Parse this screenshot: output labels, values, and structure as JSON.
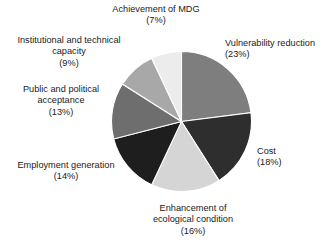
{
  "chart_data": {
    "type": "pie",
    "title": "",
    "subtitle": "",
    "xlabel": "",
    "ylabel": "",
    "legend_position": "outside-labels",
    "grid": false,
    "units": "percent",
    "start_angle_deg": 0,
    "direction": "clockwise",
    "categories": [
      "Vulnerability reduction",
      "Cost",
      "Enhancement of ecological condition",
      "Employment generation",
      "Public and political acceptance",
      "Institutional and technical capacity",
      "Achievement of MDG"
    ],
    "values": [
      23,
      18,
      16,
      14,
      13,
      9,
      7
    ],
    "colors": [
      "#7e7e7e",
      "#2e2e2e",
      "#d5d5d5",
      "#1e1e1e",
      "#6e6e6e",
      "#a8a8a8",
      "#ececec"
    ],
    "slices": [
      {
        "label": "Vulnerability reduction",
        "value": 23,
        "pct_text": "(23%)",
        "color": "#7e7e7e"
      },
      {
        "label": "Cost",
        "value": 18,
        "pct_text": "(18%)",
        "color": "#2e2e2e"
      },
      {
        "label": "Enhancement of ecological condition",
        "value": 16,
        "pct_text": "(16%)",
        "color": "#d5d5d5"
      },
      {
        "label": "Employment generation",
        "value": 14,
        "pct_text": "(14%)",
        "color": "#1e1e1e"
      },
      {
        "label": "Public and political acceptance",
        "value": 13,
        "pct_text": "(13%)",
        "color": "#6e6e6e"
      },
      {
        "label": "Institutional and technical capacity",
        "value": 9,
        "pct_text": "(9%)",
        "color": "#a8a8a8"
      },
      {
        "label": "Achievement of MDG",
        "value": 7,
        "pct_text": "(7%)",
        "color": "#ececec"
      }
    ]
  },
  "labels": {
    "mdg": {
      "line1": "Achievement of MDG",
      "pct": "(7%)"
    },
    "institutional": {
      "line1": "Institutional and technical",
      "line2": "capacity",
      "pct": "(9%)"
    },
    "public": {
      "line1": "Public and political",
      "line2": "acceptance",
      "pct": "(13%)"
    },
    "employment": {
      "line1": "Employment generation",
      "pct": "(14%)"
    },
    "enhancement": {
      "line1": "Enhancement of",
      "line2": "ecological condition",
      "pct": "(16%)"
    },
    "cost": {
      "line1": "Cost",
      "pct": "(18%)"
    },
    "vulnerability": {
      "line1": "Vulnerability reduction",
      "pct": "(23%)"
    }
  }
}
